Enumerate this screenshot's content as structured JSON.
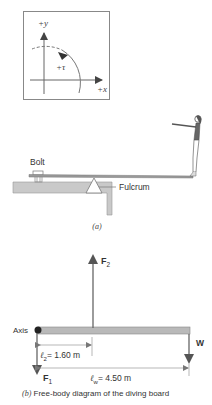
{
  "figure": {
    "axes_panel": {
      "y_label": "+y",
      "x_label": "+x",
      "rotation_label": "+τ"
    },
    "panel_a": {
      "bolt_label": "Bolt",
      "fulcrum_label": "Fulcrum",
      "caption": "(a)"
    },
    "panel_b": {
      "axis_label": "Axis",
      "f2_label": "F",
      "f2_sub": "2",
      "f1_label": "F",
      "f1_sub": "1",
      "w_label": "W",
      "l2_label": "ℓ",
      "l2_sub": "2",
      "l2_value": "= 1.60 m",
      "lw_label": "ℓ",
      "lw_sub": "w",
      "lw_value": "= 4.50 m",
      "caption_prefix": "(b)",
      "caption_text": " Free-body diagram of the diving board"
    },
    "colors": {
      "board": "#b8b8b8",
      "ledge": "#c8c8c8",
      "arrow": "#555555",
      "text": "#333333"
    }
  }
}
